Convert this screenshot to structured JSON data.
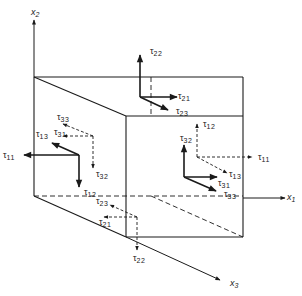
{
  "diagram": {
    "stroke_color": "#1a1a1a",
    "background": "#ffffff",
    "axes": [
      {
        "id": "x1",
        "label": "x",
        "sub": "1",
        "from": [
          243,
          198
        ],
        "to": [
          285,
          198
        ],
        "label_pos": [
          287,
          193
        ]
      },
      {
        "id": "x2",
        "label": "x",
        "sub": "2",
        "from": [
          34,
          77
        ],
        "to": [
          34,
          20
        ],
        "label_pos": [
          31,
          8
        ]
      },
      {
        "id": "x3",
        "label": "x",
        "sub": "3",
        "from": [
          126,
          237
        ],
        "to": [
          220,
          280
        ],
        "label_pos": [
          230,
          279
        ]
      }
    ],
    "cube": {
      "solid_edges": [
        [
          [
            34,
            77
          ],
          [
            243,
            77
          ]
        ],
        [
          [
            34,
            77
          ],
          [
            126,
            116
          ]
        ],
        [
          [
            243,
            77
          ],
          [
            243,
            116
          ]
        ],
        [
          [
            126,
            116
          ],
          [
            243,
            116
          ]
        ],
        [
          [
            126,
            116
          ],
          [
            126,
            237
          ]
        ],
        [
          [
            243,
            116
          ],
          [
            243,
            237
          ]
        ],
        [
          [
            126,
            237
          ],
          [
            243,
            237
          ]
        ],
        [
          [
            34,
            77
          ],
          [
            34,
            196
          ]
        ],
        [
          [
            34,
            196
          ],
          [
            126,
            237
          ]
        ]
      ],
      "dashed_edges": [
        [
          [
            34,
            196
          ],
          [
            243,
            196
          ]
        ],
        [
          [
            151,
            77
          ],
          [
            151,
            116
          ]
        ],
        [
          [
            151,
            196
          ],
          [
            243,
            237
          ]
        ]
      ]
    },
    "faces": [
      {
        "id": "top-face",
        "arrows": [
          {
            "name": "tau22",
            "label": "τ",
            "sub": "22",
            "from": [
              140,
              97
            ],
            "to": [
              140,
              55
            ],
            "style": "solid",
            "label_pos": [
              150,
              47
            ]
          },
          {
            "name": "tau21",
            "label": "τ",
            "sub": "21",
            "from": [
              140,
              97
            ],
            "to": [
              177,
              97
            ],
            "style": "solid",
            "label_pos": [
              178,
              92
            ]
          },
          {
            "name": "tau23",
            "label": "τ",
            "sub": "23",
            "from": [
              140,
              97
            ],
            "to": [
              168,
              110
            ],
            "style": "solid",
            "label_pos": [
              176,
              107
            ]
          }
        ]
      },
      {
        "id": "left-face",
        "arrows": [
          {
            "name": "tau11",
            "label": "τ",
            "sub": "11",
            "from": [
              79,
              155
            ],
            "to": [
              24,
              155
            ],
            "style": "solid",
            "label_pos": [
              3,
              151
            ]
          },
          {
            "name": "tau12",
            "label": "τ",
            "sub": "12",
            "from": [
              79,
              155
            ],
            "to": [
              79,
              187
            ],
            "style": "solid",
            "label_pos": [
              84,
              188
            ]
          },
          {
            "name": "tau13",
            "label": "τ",
            "sub": "13",
            "from": [
              79,
              155
            ],
            "to": [
              52,
              143
            ],
            "style": "solid",
            "label_pos": [
              36,
              130
            ]
          },
          {
            "name": "tau31",
            "label": "τ",
            "sub": "31",
            "from": [
              93,
              136
            ],
            "to": [
              63,
              136
            ],
            "style": "dashed",
            "label_pos": [
              54,
              128
            ]
          },
          {
            "name": "tau33",
            "label": "τ",
            "sub": "33",
            "from": [
              93,
              136
            ],
            "to": [
              63,
              124
            ],
            "style": "dashed",
            "label_pos": [
              57,
              113
            ]
          },
          {
            "name": "tau32",
            "label": "τ",
            "sub": "32",
            "from": [
              93,
              136
            ],
            "to": [
              93,
              168
            ],
            "style": "dashed",
            "label_pos": [
              96,
              170
            ]
          }
        ]
      },
      {
        "id": "right-face",
        "arrows": [
          {
            "name": "tau12-right",
            "label": "τ",
            "sub": "12",
            "from": [
              197,
              157
            ],
            "to": [
              197,
              124
            ],
            "style": "dashed",
            "label_pos": [
              203,
              120
            ]
          },
          {
            "name": "tau11-right",
            "label": "τ",
            "sub": "11",
            "from": [
              197,
              157
            ],
            "to": [
              252,
              157
            ],
            "style": "dashed",
            "label_pos": [
              258,
              153
            ]
          },
          {
            "name": "tau13-right",
            "label": "τ",
            "sub": "13",
            "from": [
              197,
              157
            ],
            "to": [
              227,
              173
            ],
            "style": "dashed",
            "label_pos": [
              229,
              170
            ]
          },
          {
            "name": "tau32-right",
            "label": "τ",
            "sub": "32",
            "from": [
              184,
              177
            ],
            "to": [
              184,
              145
            ],
            "style": "solid",
            "label_pos": [
              180,
              134
            ]
          },
          {
            "name": "tau31-right",
            "label": "τ",
            "sub": "31",
            "from": [
              184,
              177
            ],
            "to": [
              217,
              177
            ],
            "style": "solid",
            "label_pos": [
              218,
              179
            ]
          },
          {
            "name": "tau33-right",
            "label": "τ",
            "sub": "33",
            "from": [
              184,
              177
            ],
            "to": [
              216,
              191
            ],
            "style": "solid",
            "label_pos": [
              224,
              190
            ]
          }
        ]
      },
      {
        "id": "bottom-face",
        "arrows": [
          {
            "name": "tau22-bottom",
            "label": "τ",
            "sub": "22",
            "from": [
              137,
              217
            ],
            "to": [
              137,
              250
            ],
            "style": "dashed",
            "label_pos": [
              133,
              254
            ]
          },
          {
            "name": "tau21-bottom",
            "label": "τ",
            "sub": "21",
            "from": [
              137,
              217
            ],
            "to": [
              104,
              217
            ],
            "style": "dashed",
            "label_pos": [
              99,
              218
            ]
          },
          {
            "name": "tau23-bottom",
            "label": "τ",
            "sub": "23",
            "from": [
              137,
              217
            ],
            "to": [
              110,
              205
            ],
            "style": "dashed",
            "label_pos": [
              96,
              197
            ]
          }
        ]
      }
    ]
  }
}
